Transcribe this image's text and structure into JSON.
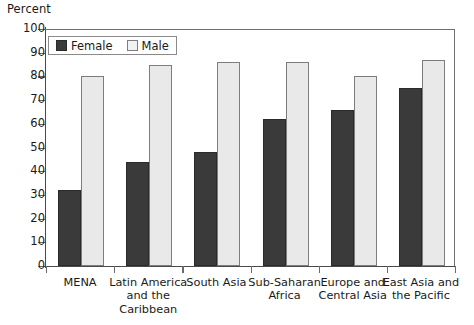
{
  "chart_data": {
    "type": "bar",
    "title": "",
    "xlabel": "",
    "ylabel": "Percent",
    "ylim": [
      0,
      100
    ],
    "ytick_step": 10,
    "yticks": [
      100,
      90,
      80,
      70,
      60,
      50,
      40,
      30,
      20,
      10,
      0
    ],
    "grid": false,
    "legend_position": "top-left-inside",
    "categories": [
      "MENA",
      "Latin America\nand the\nCaribbean",
      "South Asia",
      "Sub-Saharan\nAfrica",
      "Europe and\nCentral Asia",
      "East Asia and\nthe Pacific"
    ],
    "series": [
      {
        "name": "Female",
        "color": "#3a3a3a",
        "values": [
          32,
          44,
          48,
          62,
          66,
          75
        ]
      },
      {
        "name": "Male",
        "color": "#e9e9e9",
        "values": [
          80,
          85,
          86,
          86,
          80,
          87
        ]
      }
    ]
  },
  "axis": {
    "y_title": "Percent"
  },
  "legend": {
    "entries": [
      {
        "label": "Female",
        "swatch": "female-swatch"
      },
      {
        "label": "Male",
        "swatch": "male-swatch"
      }
    ]
  },
  "colors": {
    "female_bar": "#3a3a3a",
    "male_bar": "#e9e9e9",
    "male_bar_border": "#7d7d7d",
    "axis": "#4a4a4a",
    "text": "#1a1a1a",
    "background": "#ffffff"
  }
}
